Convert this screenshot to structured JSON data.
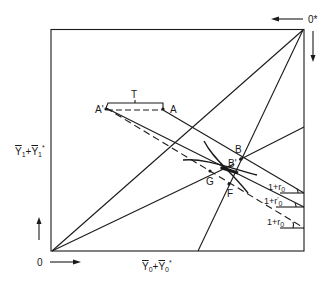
{
  "diagram": {
    "origin_label": "0",
    "origin_star_label": "0*",
    "x_axis_label": {
      "base": "Y",
      "sub0": "0",
      "plus": "+",
      "base2": "Y",
      "sub1": "0",
      "star": "*"
    },
    "y_axis_label": {
      "base": "Y",
      "sub0": "1",
      "plus": "+",
      "base2": "Y",
      "sub1": "1",
      "star": "*"
    },
    "points": {
      "A_prime": "A'",
      "A": "A",
      "T": "T",
      "B": "B",
      "B_prime": "B'",
      "G": "G",
      "F": "F"
    },
    "slope_labels": [
      {
        "one": "1+",
        "r": "r",
        "sub": "0",
        "prime": ""
      },
      {
        "one": "1+",
        "r": "r",
        "sub": "0",
        "prime": "'"
      },
      {
        "one": "1+",
        "r": "r",
        "sub": "0",
        "prime": ""
      }
    ],
    "colors": {
      "ink": "#1a1a1a",
      "background": "#ffffff"
    }
  }
}
